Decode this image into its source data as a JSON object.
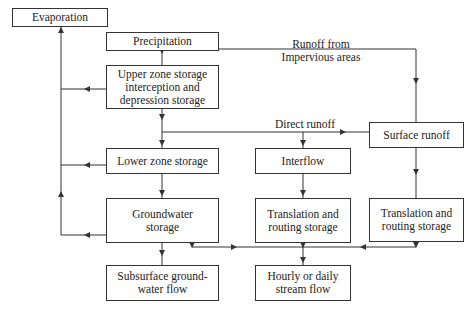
{
  "diagram": {
    "type": "flowchart",
    "topic": "Hydrologic runoff model structure",
    "nodes": {
      "evaporation": "Evaporation",
      "precipitation": "Precipitation",
      "upper_zone": "Upper zone storage interception and depression storage",
      "lower_zone": "Lower zone storage",
      "groundwater": "Groundwater storage",
      "subsurface": "Subsurface ground-water flow",
      "interflow": "Interflow",
      "translation_mid": "Translation and routing storage",
      "hourly": "Hourly or daily stream flow",
      "surface_runoff": "Surface runoff",
      "translation_right": "Translation and routing storage"
    },
    "edge_labels": {
      "runoff_impervious_line1": "Runoff from",
      "runoff_impervious_line2": "Impervious areas",
      "direct_runoff": "Direct runoff"
    },
    "edges": [
      {
        "from": "precipitation",
        "to": "upper_zone"
      },
      {
        "from": "precipitation",
        "to": "surface_runoff",
        "label": "Runoff from Impervious areas"
      },
      {
        "from": "upper_zone",
        "to": "lower_zone"
      },
      {
        "from": "upper_zone",
        "to": "surface_runoff",
        "label": "Direct runoff"
      },
      {
        "from": "upper_zone",
        "to": "interflow"
      },
      {
        "from": "upper_zone",
        "to": "evaporation"
      },
      {
        "from": "lower_zone",
        "to": "groundwater"
      },
      {
        "from": "lower_zone",
        "to": "evaporation"
      },
      {
        "from": "groundwater",
        "to": "evaporation"
      },
      {
        "from": "groundwater",
        "to": "subsurface"
      },
      {
        "from": "groundwater",
        "to": "hourly"
      },
      {
        "from": "interflow",
        "to": "translation_mid"
      },
      {
        "from": "translation_mid",
        "to": "hourly"
      },
      {
        "from": "surface_runoff",
        "to": "translation_right"
      },
      {
        "from": "translation_right",
        "to": "hourly"
      }
    ]
  },
  "display": {
    "upper_zone_l1": "Upper zone storage",
    "upper_zone_l2": "interception and",
    "upper_zone_l3": "depression storage",
    "groundwater_l1": "Groundwater",
    "groundwater_l2": "storage",
    "subsurface_l1": "Subsurface ground-",
    "subsurface_l2": "water flow",
    "translation_l1": "Translation and",
    "translation_l2": "routing storage",
    "hourly_l1": "Hourly or daily",
    "hourly_l2": "stream flow"
  }
}
